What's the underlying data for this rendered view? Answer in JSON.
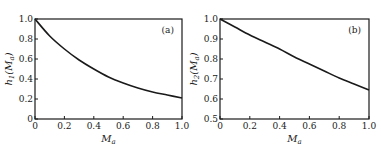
{
  "chart_data": [
    {
      "type": "line",
      "panel_label": "(a)",
      "title": "",
      "xlabel": "M_a",
      "ylabel": "h_1(M_a)",
      "xlim": [
        0,
        1.0
      ],
      "ylim": [
        0,
        1.0
      ],
      "xticks": [
        "0",
        "0.2",
        "0.4",
        "0.6",
        "0.8",
        "1.0"
      ],
      "yticks": [
        "0",
        "0.2",
        "0.4",
        "0.6",
        "0.8",
        "1.0"
      ],
      "grid": false,
      "series": [
        {
          "name": "h1",
          "x": [
            0,
            0.1,
            0.2,
            0.3,
            0.4,
            0.5,
            0.6,
            0.7,
            0.8,
            0.9,
            1.0
          ],
          "values": [
            1.0,
            0.83,
            0.7,
            0.59,
            0.5,
            0.42,
            0.36,
            0.31,
            0.27,
            0.24,
            0.21
          ]
        }
      ]
    },
    {
      "type": "line",
      "panel_label": "(b)",
      "title": "",
      "xlabel": "M_a",
      "ylabel": "h_2(M_a)",
      "xlim": [
        0,
        1.0
      ],
      "ylim": [
        0.5,
        1.0
      ],
      "xticks": [
        "0",
        "0.2",
        "0.4",
        "0.6",
        "0.8",
        "1.0"
      ],
      "yticks": [
        "0.5",
        "0.6",
        "0.7",
        "0.8",
        "0.9",
        "1.0"
      ],
      "grid": false,
      "series": [
        {
          "name": "h2",
          "x": [
            0,
            0.1,
            0.2,
            0.3,
            0.4,
            0.5,
            0.6,
            0.7,
            0.8,
            0.9,
            1.0
          ],
          "values": [
            1.0,
            0.96,
            0.92,
            0.885,
            0.85,
            0.81,
            0.775,
            0.74,
            0.705,
            0.675,
            0.645
          ]
        }
      ]
    }
  ]
}
